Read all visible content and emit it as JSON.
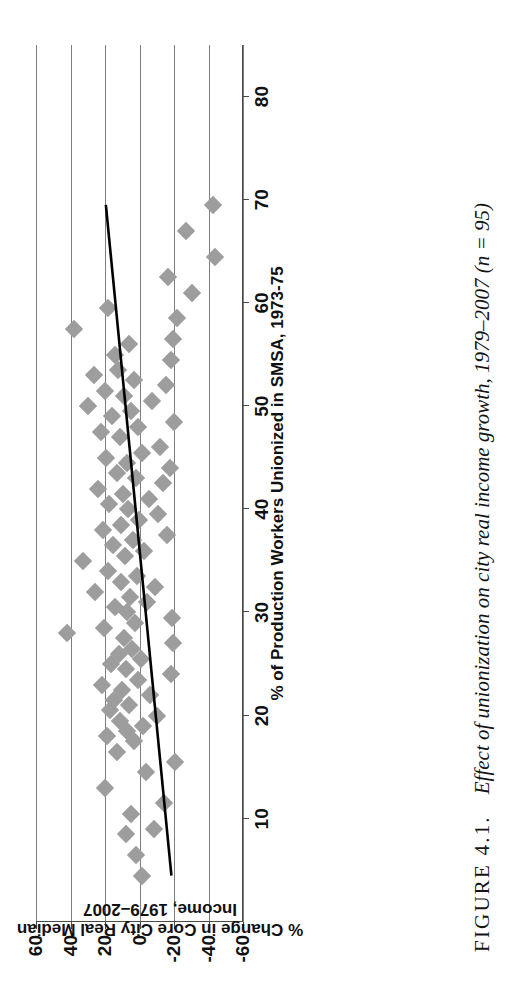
{
  "figure": {
    "label": "FIGURE 4.1.",
    "caption": "Effect of unionization on city real income growth, 1979–2007 (n = 95)"
  },
  "chart_data": {
    "type": "scatter",
    "title": "",
    "xlabel": "% of Production Workers Unionized in SMSA, 1973-75",
    "ylabel": "% Change in Core City Real Median Income, 1979–2007",
    "xlim": [
      0,
      85
    ],
    "ylim": [
      -60,
      60
    ],
    "xticks": [
      10,
      20,
      30,
      40,
      50,
      60,
      70,
      80
    ],
    "xticklabels": [
      "10",
      "20",
      "30",
      "40",
      "50",
      "60",
      "70",
      "80"
    ],
    "yticks": [
      -60,
      -40,
      -20,
      0,
      20,
      40,
      60
    ],
    "yticklabels": [
      "-60",
      "-40",
      "-20",
      "0",
      "20",
      "40",
      "60"
    ],
    "grid": "y-gridlines-only",
    "legend": "none",
    "n": 95,
    "marker": {
      "shape": "diamond",
      "color": "#9d9d9d",
      "size": 13
    },
    "trendline": {
      "type": "linear",
      "color": "#000000",
      "x_start": 4.5,
      "y_start": -18.5,
      "x_end": 69.5,
      "y_end": 19.5
    },
    "points": [
      {
        "x": 4.5,
        "y": -1.5
      },
      {
        "x": 6.5,
        "y": 2.0
      },
      {
        "x": 8.5,
        "y": 8.0
      },
      {
        "x": 9.0,
        "y": -8.5
      },
      {
        "x": 10.5,
        "y": 5.0
      },
      {
        "x": 11.5,
        "y": -14.0
      },
      {
        "x": 13.0,
        "y": 20.0
      },
      {
        "x": 14.5,
        "y": -4.0
      },
      {
        "x": 15.5,
        "y": -20.5
      },
      {
        "x": 16.5,
        "y": 13.0
      },
      {
        "x": 17.5,
        "y": 3.0
      },
      {
        "x": 18.0,
        "y": 19.0
      },
      {
        "x": 18.5,
        "y": 7.5
      },
      {
        "x": 19.0,
        "y": -2.0
      },
      {
        "x": 19.5,
        "y": 11.5
      },
      {
        "x": 20.0,
        "y": -10.0
      },
      {
        "x": 20.5,
        "y": 17.0
      },
      {
        "x": 21.0,
        "y": 6.0
      },
      {
        "x": 21.5,
        "y": 14.5
      },
      {
        "x": 22.0,
        "y": -6.0
      },
      {
        "x": 22.5,
        "y": 10.0
      },
      {
        "x": 23.0,
        "y": 22.0
      },
      {
        "x": 23.5,
        "y": 1.0
      },
      {
        "x": 24.0,
        "y": -18.0
      },
      {
        "x": 24.5,
        "y": 8.0
      },
      {
        "x": 25.0,
        "y": 16.5
      },
      {
        "x": 25.5,
        "y": -1.0
      },
      {
        "x": 26.0,
        "y": 12.0
      },
      {
        "x": 26.5,
        "y": 4.5
      },
      {
        "x": 27.0,
        "y": -19.5
      },
      {
        "x": 27.5,
        "y": 9.0
      },
      {
        "x": 28.0,
        "y": 42.0
      },
      {
        "x": 28.5,
        "y": 20.5
      },
      {
        "x": 29.0,
        "y": 2.5
      },
      {
        "x": 29.5,
        "y": -19.0
      },
      {
        "x": 30.0,
        "y": 7.0
      },
      {
        "x": 30.5,
        "y": 14.0
      },
      {
        "x": 31.0,
        "y": -4.5
      },
      {
        "x": 31.5,
        "y": 5.5
      },
      {
        "x": 32.0,
        "y": 26.0
      },
      {
        "x": 32.5,
        "y": -9.0
      },
      {
        "x": 33.0,
        "y": 11.0
      },
      {
        "x": 33.5,
        "y": 1.5
      },
      {
        "x": 34.0,
        "y": 18.0
      },
      {
        "x": 35.0,
        "y": 33.0
      },
      {
        "x": 35.5,
        "y": 8.5
      },
      {
        "x": 36.0,
        "y": -2.5
      },
      {
        "x": 36.5,
        "y": 15.5
      },
      {
        "x": 37.0,
        "y": 3.5
      },
      {
        "x": 37.5,
        "y": -16.0
      },
      {
        "x": 38.0,
        "y": 21.0
      },
      {
        "x": 38.5,
        "y": 10.5
      },
      {
        "x": 39.0,
        "y": 0.5
      },
      {
        "x": 39.5,
        "y": -11.0
      },
      {
        "x": 40.0,
        "y": 6.5
      },
      {
        "x": 40.5,
        "y": 17.5
      },
      {
        "x": 41.0,
        "y": -5.5
      },
      {
        "x": 41.5,
        "y": 9.5
      },
      {
        "x": 42.0,
        "y": 24.0
      },
      {
        "x": 42.5,
        "y": -13.5
      },
      {
        "x": 43.0,
        "y": 2.0
      },
      {
        "x": 43.5,
        "y": 13.0
      },
      {
        "x": 44.0,
        "y": -17.5
      },
      {
        "x": 44.5,
        "y": 7.0
      },
      {
        "x": 45.0,
        "y": 19.5
      },
      {
        "x": 45.5,
        "y": -1.5
      },
      {
        "x": 46.0,
        "y": -12.0
      },
      {
        "x": 47.0,
        "y": 11.5
      },
      {
        "x": 47.5,
        "y": 22.5
      },
      {
        "x": 48.0,
        "y": 1.0
      },
      {
        "x": 48.5,
        "y": -20.0
      },
      {
        "x": 49.0,
        "y": 16.0
      },
      {
        "x": 49.5,
        "y": 5.0
      },
      {
        "x": 50.0,
        "y": 30.0
      },
      {
        "x": 50.5,
        "y": -7.0
      },
      {
        "x": 51.0,
        "y": 9.0
      },
      {
        "x": 51.5,
        "y": 20.0
      },
      {
        "x": 52.0,
        "y": -15.5
      },
      {
        "x": 52.5,
        "y": 3.0
      },
      {
        "x": 53.0,
        "y": 26.5
      },
      {
        "x": 53.5,
        "y": 12.5
      },
      {
        "x": 54.5,
        "y": -18.5
      },
      {
        "x": 55.0,
        "y": 14.0
      },
      {
        "x": 56.0,
        "y": 6.0
      },
      {
        "x": 56.5,
        "y": -19.5
      },
      {
        "x": 57.5,
        "y": 38.0
      },
      {
        "x": 58.5,
        "y": -21.5
      },
      {
        "x": 59.5,
        "y": 18.0
      },
      {
        "x": 61.0,
        "y": -30.5
      },
      {
        "x": 62.5,
        "y": -16.5
      },
      {
        "x": 64.5,
        "y": -44.0
      },
      {
        "x": 67.0,
        "y": -27.0
      },
      {
        "x": 69.5,
        "y": -42.5
      }
    ]
  }
}
